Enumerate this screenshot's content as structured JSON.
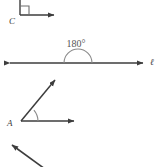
{
  "figure": {
    "width": 158,
    "height": 167,
    "background_color": "#ffffff",
    "stroke_color": "#3d3d3d",
    "arc_color": "#8a8a8a",
    "label_color": "#3a3a3a"
  },
  "right_angle_figure": {
    "name": "right angle at C",
    "vertex_label": "C",
    "vertex": {
      "x": 20,
      "y": 15
    },
    "vertical_ray_end": {
      "x": 20,
      "y": 0
    },
    "horizontal_ray_end": {
      "x": 60,
      "y": 15
    },
    "square_mark_size": 9,
    "label_position": {
      "x": 9,
      "y": 24
    }
  },
  "straight_angle_figure": {
    "name": "straight angle on line",
    "measure_text": "180°",
    "line_label": "ℓ",
    "line_y": 63,
    "line_start_x": 4,
    "line_end_x": 148,
    "arc_center": {
      "x": 78,
      "y": 63
    },
    "arc_radius": 14,
    "measure_position": {
      "x": 76,
      "y": 47
    },
    "line_label_position": {
      "x": 152,
      "y": 64
    }
  },
  "acute_angle_figure": {
    "name": "acute angle at A",
    "vertex_label": "A",
    "vertex": {
      "x": 21,
      "y": 121
    },
    "upper_ray_end": {
      "x": 59,
      "y": 75
    },
    "horizontal_ray_end": {
      "x": 80,
      "y": 121
    },
    "arc_radius": 17,
    "label_position": {
      "x": 9,
      "y": 126
    }
  },
  "partial_ray_figure": {
    "name": "partial ray lower left",
    "arrow_tip": {
      "x": 7,
      "y": 141
    },
    "tail": {
      "x": 45,
      "y": 167
    }
  }
}
